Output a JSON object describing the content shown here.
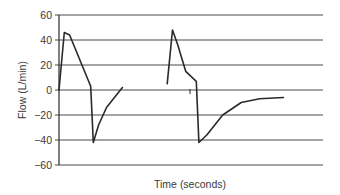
{
  "chart_data": {
    "type": "line",
    "title": "",
    "xlabel": "Time (seconds)",
    "ylabel": "Flow (L/min)",
    "ylim": [
      -60,
      60
    ],
    "yticks": [
      60,
      40,
      20,
      0,
      -20,
      -40,
      -60
    ],
    "ytick_labels": [
      "60",
      "40",
      "20",
      "0",
      "−20",
      "−40",
      "−60"
    ],
    "grid": true,
    "legend": "none",
    "x_tick_labels": [],
    "series": [
      {
        "name": "Breath 1",
        "points": [
          [
            0.0,
            0
          ],
          [
            0.02,
            46
          ],
          [
            0.04,
            44
          ],
          [
            0.12,
            3
          ],
          [
            0.13,
            -42
          ],
          [
            0.15,
            -28
          ],
          [
            0.18,
            -14
          ],
          [
            0.24,
            2
          ]
        ]
      },
      {
        "name": "Breath 2",
        "points": [
          [
            0.41,
            5
          ],
          [
            0.43,
            48
          ],
          [
            0.45,
            36
          ],
          [
            0.48,
            15
          ],
          [
            0.52,
            7
          ],
          [
            0.53,
            -42
          ],
          [
            0.56,
            -36
          ],
          [
            0.62,
            -20
          ],
          [
            0.69,
            -10
          ],
          [
            0.76,
            -7
          ],
          [
            0.85,
            -6
          ]
        ]
      }
    ],
    "colors": {
      "line": "#2a2a2a",
      "grid": "#4a4a4a",
      "text": "#3a3a3a"
    }
  }
}
